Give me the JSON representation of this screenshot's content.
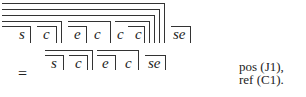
{
  "expression_top": {
    "symbols": [
      "s",
      "c",
      "e",
      "c",
      "c",
      "c",
      "se"
    ]
  },
  "expression_bottom": {
    "equals": "=",
    "symbols": [
      "s",
      "c",
      "e",
      "c",
      "se"
    ]
  },
  "annotations": {
    "line1": "pos (J1),",
    "line2": "ref (C1)."
  }
}
